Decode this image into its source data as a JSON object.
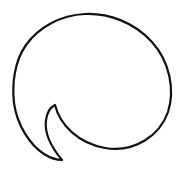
{
  "image": {
    "subject": "speech-bubble-icon",
    "style": "hand-drawn outline",
    "width": 183,
    "height": 174
  },
  "colors": {
    "background": "#ffffff",
    "stroke": "#111111",
    "fill": "#ffffff"
  },
  "icon": {
    "name": "speech-bubble-icon",
    "stroke_width": 2.2
  }
}
